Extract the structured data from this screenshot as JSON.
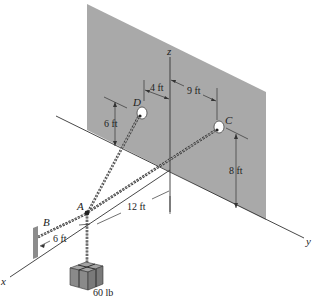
{
  "figure": {
    "colors": {
      "wall": "#a9a9a9",
      "support_plate": "#8c8c8c",
      "crate": "#8a8a8a",
      "line": "#333333",
      "background": "#ffffff"
    },
    "axes": {
      "x_label": "x",
      "y_label": "y",
      "z_label": "z"
    },
    "points": {
      "A": "A",
      "B": "B",
      "C": "C",
      "D": "D"
    },
    "dimensions": {
      "d_to_z_axis": "4 ft",
      "z_axis_to_c": "9 ft",
      "d_height": "6 ft",
      "c_height": "8 ft",
      "a_to_wall": "12 ft",
      "b_to_a": "6 ft"
    },
    "load": {
      "label": "60 lb"
    }
  }
}
